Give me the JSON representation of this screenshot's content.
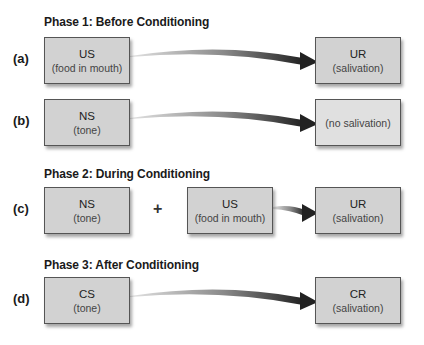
{
  "phases": [
    {
      "title": "Phase 1: Before Conditioning"
    },
    {
      "title": "Phase 2: During Conditioning"
    },
    {
      "title": "Phase 3: After Conditioning"
    }
  ],
  "rows": {
    "a": {
      "label": "(a)",
      "stimulus": {
        "main": "US",
        "sub": "(food in mouth)"
      },
      "response": {
        "main": "UR",
        "sub": "(salivation)"
      }
    },
    "b": {
      "label": "(b)",
      "stimulus": {
        "main": "NS",
        "sub": "(tone)"
      },
      "response": {
        "main": "",
        "sub": "(no salivation)"
      }
    },
    "c": {
      "label": "(c)",
      "stimulus1": {
        "main": "NS",
        "sub": "(tone)"
      },
      "operator": "+",
      "stimulus2": {
        "main": "US",
        "sub": "(food in mouth)"
      },
      "response": {
        "main": "UR",
        "sub": "(salivation)"
      }
    },
    "d": {
      "label": "(d)",
      "stimulus": {
        "main": "CS",
        "sub": "(tone)"
      },
      "response": {
        "main": "CR",
        "sub": "(salivation)"
      }
    }
  },
  "colors": {
    "box_fill": "#d2d2d2",
    "box_border": "#555555",
    "arrow_start": "#d8d8d8",
    "arrow_end": "#2a2a2a"
  }
}
